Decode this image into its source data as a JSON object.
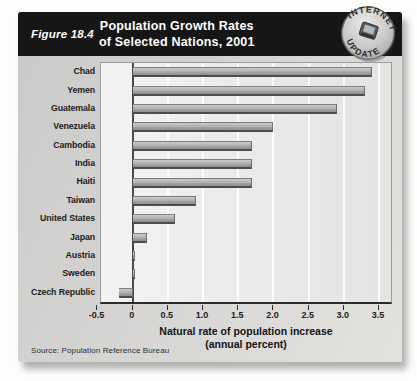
{
  "figure": {
    "label": "Figure 18.4",
    "title_line1": "Population Growth Rates",
    "title_line2": "of Selected Nations, 2001"
  },
  "badge": {
    "top_text": "INTERNET",
    "bottom_text": "UPDATE",
    "icon": "laptop-icon"
  },
  "chart_data": {
    "type": "bar",
    "orientation": "horizontal",
    "title": "Population Growth Rates of Selected Nations, 2001",
    "categories": [
      "Chad",
      "Yemen",
      "Guatemala",
      "Venezuela",
      "Cambodia",
      "India",
      "Haiti",
      "Taiwan",
      "United States",
      "Japan",
      "Austria",
      "Sweden",
      "Czech Republic"
    ],
    "values": [
      3.4,
      3.3,
      2.9,
      2.0,
      1.7,
      1.7,
      1.7,
      0.9,
      0.6,
      0.2,
      0.0,
      0.0,
      -0.2
    ],
    "xlabel_line1": "Natural rate of population increase",
    "xlabel_line2": "(annual percent)",
    "ylabel": "",
    "xlim": [
      -0.45,
      3.67
    ],
    "xticks": [
      -0.5,
      0,
      0.5,
      1.0,
      1.5,
      2.0,
      2.5,
      3.0,
      3.5
    ],
    "xtick_labels": [
      "-0.5",
      "0",
      "0.5",
      "1.0",
      "1.5",
      "2.0",
      "2.5",
      "3.0",
      "3.5"
    ],
    "grid": true,
    "legend": false
  },
  "source": "Source:  Population Reference Bureau",
  "colors": {
    "header_bg": "#161616",
    "header_text": "#ffffff",
    "card_bg": "#d5d4d2",
    "plot_bg": "#ebeae8",
    "gridline": "#fcfcfa",
    "bar_fill": "#a8a8a6",
    "bar_shadow": "#4d4d4b",
    "badge_silver": "#c9c9c7"
  }
}
